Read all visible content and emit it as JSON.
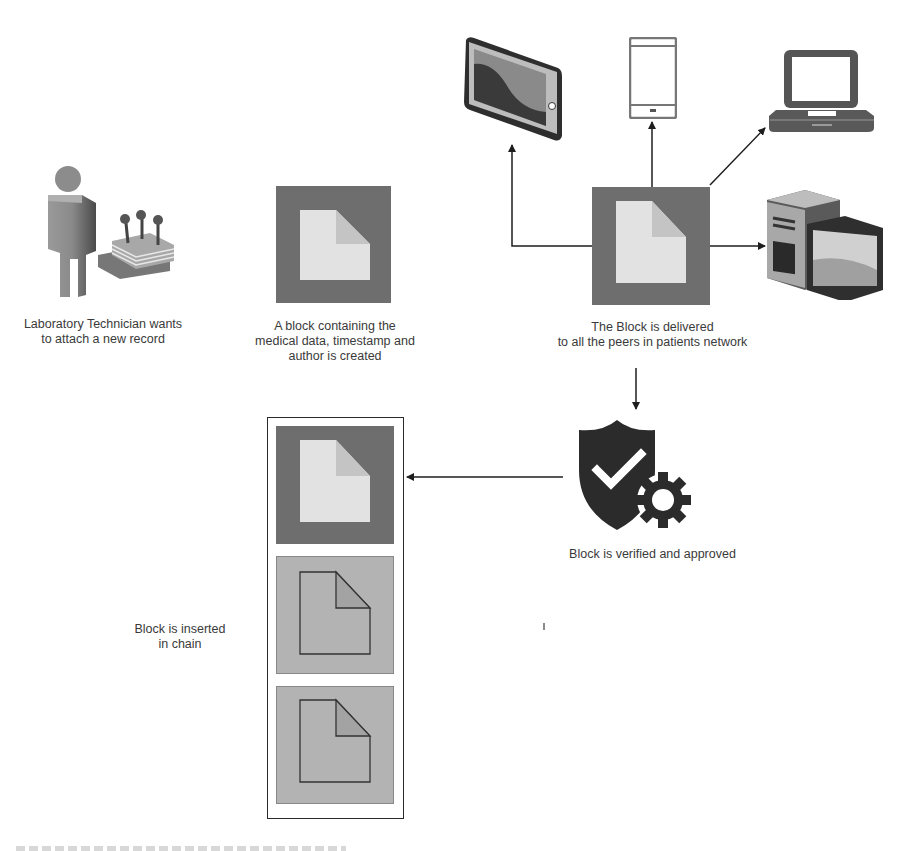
{
  "diagram": {
    "nodes": {
      "technician": {
        "label_line1": "Laboratory Technician wants",
        "label_line2": "to attach a new  record",
        "icon": "person-with-equipment-icon"
      },
      "block_created": {
        "label_line1": "A block containing the",
        "label_line2": "medical data, timestamp and",
        "label_line3": "author is created",
        "icon": "block-document-icon"
      },
      "block_delivered": {
        "label_line1": "The Block is delivered",
        "label_line2": "to all the peers in patients network",
        "icon": "block-document-icon"
      },
      "peers": [
        {
          "name": "tablet",
          "icon": "tablet-icon"
        },
        {
          "name": "smartphone",
          "icon": "smartphone-icon"
        },
        {
          "name": "laptop",
          "icon": "laptop-icon"
        },
        {
          "name": "desktop",
          "icon": "desktop-computer-icon"
        }
      ],
      "verified": {
        "label": "Block is verified and approved",
        "icon": "shield-check-gear-icon"
      },
      "chain": {
        "label_line1": "Block is inserted",
        "label_line2": "in chain",
        "blocks": [
          {
            "state": "new"
          },
          {
            "state": "existing"
          },
          {
            "state": "existing"
          }
        ]
      }
    },
    "edges": [
      {
        "from": "block_delivered",
        "to": "tablet"
      },
      {
        "from": "block_delivered",
        "to": "smartphone"
      },
      {
        "from": "block_delivered",
        "to": "laptop"
      },
      {
        "from": "block_delivered",
        "to": "desktop"
      },
      {
        "from": "block_delivered",
        "to": "verified"
      },
      {
        "from": "verified",
        "to": "chain"
      }
    ],
    "colors": {
      "block_dark": "#6e6e6e",
      "block_light": "#e2e2e2",
      "block_fold": "#c4c4c4",
      "block_old": "#b3b3b3",
      "icon_dark": "#2b2b2b",
      "line": "#1e1e1e"
    }
  }
}
